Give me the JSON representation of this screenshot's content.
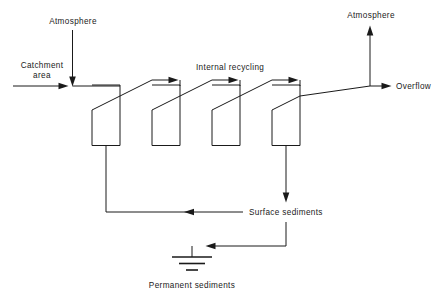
{
  "diagram": {
    "type": "process-flow-diagram",
    "title_visible": false,
    "background_color": "#ffffff",
    "line_color": "#1a1a1a",
    "labels": {
      "atmosphere_left": "Atmosphere",
      "catchment_area_line1": "Catchment",
      "catchment_area_line2": "area",
      "internal_recycling": "Internal recycling",
      "atmosphere_right": "Atmosphere",
      "overflow": "Overflow",
      "surface_sediments": "Surface sediments",
      "permanent_sediments": "Permanent sediments"
    },
    "nodes": [
      {
        "id": "vessel-1",
        "label": "",
        "x": 92,
        "y": 85,
        "width": 28,
        "height": 61
      },
      {
        "id": "vessel-2",
        "label": "",
        "x": 152,
        "y": 85,
        "width": 28,
        "height": 61
      },
      {
        "id": "vessel-3",
        "label": "",
        "x": 212,
        "y": 85,
        "width": 28,
        "height": 61
      },
      {
        "id": "vessel-4",
        "label": "",
        "x": 272,
        "y": 85,
        "width": 28,
        "height": 61
      }
    ],
    "flows": [
      {
        "id": "inflow-catchment",
        "from": "catchment-area",
        "to": "vessel-1",
        "direction": "right"
      },
      {
        "id": "inflow-atmosphere",
        "from": "atmosphere-left",
        "to": "vessel-1",
        "direction": "down"
      },
      {
        "id": "recycle-1-2",
        "from": "vessel-1",
        "to": "vessel-2",
        "direction": "right"
      },
      {
        "id": "recycle-2-3",
        "from": "vessel-2",
        "to": "vessel-3",
        "direction": "right"
      },
      {
        "id": "recycle-3-4",
        "from": "vessel-3",
        "to": "vessel-4",
        "direction": "right"
      },
      {
        "id": "outflow-atmosphere",
        "from": "vessel-4",
        "to": "atmosphere-right",
        "direction": "up"
      },
      {
        "id": "outflow-overflow",
        "from": "vessel-4",
        "to": "overflow",
        "direction": "right"
      },
      {
        "id": "settling-vessel-1",
        "from": "vessel-1",
        "to": "surface-sediments",
        "direction": "down"
      },
      {
        "id": "settling-vessel-4",
        "from": "vessel-4",
        "to": "surface-sediments",
        "direction": "down"
      },
      {
        "id": "burial",
        "from": "surface-sediments",
        "to": "permanent-sediments",
        "direction": "left-down"
      }
    ]
  }
}
